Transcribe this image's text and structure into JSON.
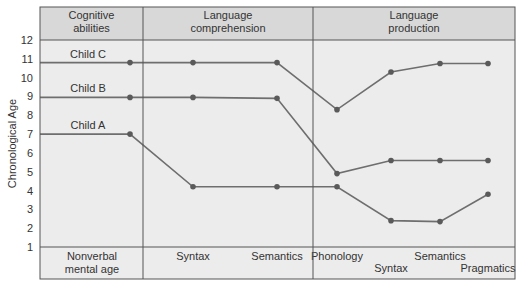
{
  "chart_data": {
    "type": "line",
    "title": "",
    "ylabel": "Chronological Age",
    "xlabel": "",
    "ylim": [
      1,
      12
    ],
    "yticks": [
      1,
      2,
      3,
      4,
      5,
      6,
      7,
      8,
      9,
      10,
      11,
      12
    ],
    "grid": false,
    "panels": [
      {
        "title_lines": [
          "Cognitive",
          "abilities"
        ]
      },
      {
        "title_lines": [
          "Language",
          "comprehension"
        ]
      },
      {
        "title_lines": [
          "Language",
          "production"
        ]
      }
    ],
    "categories": [
      {
        "label_lines": [
          "Nonverbal",
          "mental age"
        ],
        "panel": 0
      },
      {
        "label_lines": [
          "Syntax"
        ],
        "panel": 1
      },
      {
        "label_lines": [
          "Semantics"
        ],
        "panel": 1
      },
      {
        "label_lines": [
          "Phonology"
        ],
        "panel": 2
      },
      {
        "label_lines": [
          "Syntax"
        ],
        "panel": 2,
        "row": 2
      },
      {
        "label_lines": [
          "Semantics"
        ],
        "panel": 2
      },
      {
        "label_lines": [
          "Pragmatics"
        ],
        "panel": 2,
        "row": 2
      }
    ],
    "series": [
      {
        "name": "Child C",
        "start_value": 10.8,
        "values": [
          10.8,
          10.8,
          10.8,
          8.3,
          10.3,
          10.75,
          10.75
        ]
      },
      {
        "name": "Child B",
        "start_value": 8.95,
        "values": [
          8.95,
          8.95,
          8.9,
          4.9,
          5.6,
          5.6,
          5.6
        ]
      },
      {
        "name": "Child A",
        "start_value": 7.0,
        "values": [
          7.0,
          4.2,
          4.2,
          4.2,
          2.4,
          2.35,
          3.8
        ]
      }
    ],
    "colors": {
      "panel_bg": "#ececec",
      "header_bg": "#d8d8d8",
      "line": "#6e6e6e",
      "marker": "#5a5a5a",
      "border": "#555555"
    }
  }
}
